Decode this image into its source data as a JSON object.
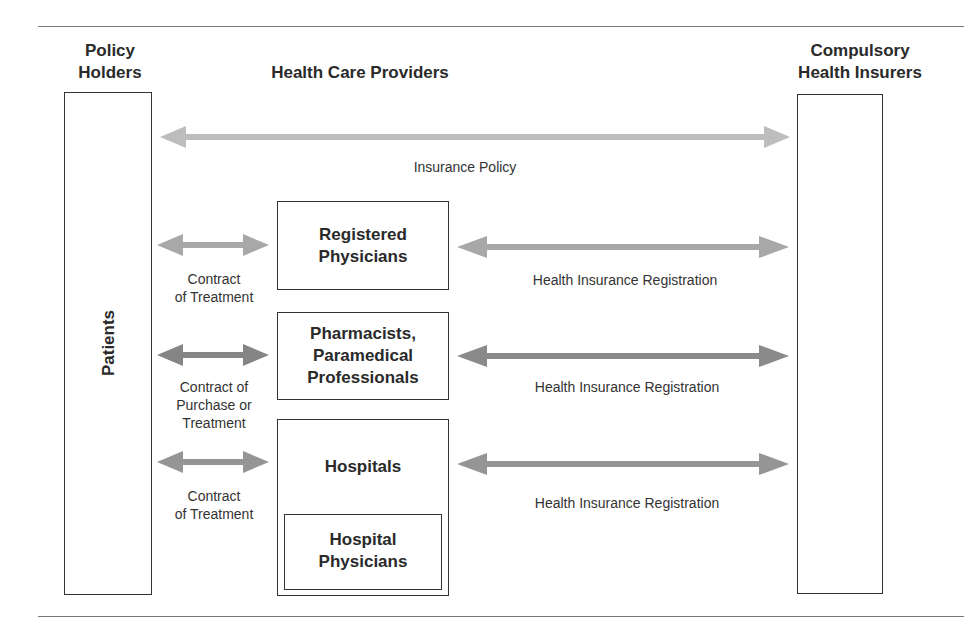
{
  "headers": {
    "policy_holders": [
      "Policy",
      "Holders"
    ],
    "providers": "Health Care Providers",
    "insurers": [
      "Compulsory",
      "Health Insurers"
    ]
  },
  "left_box": {
    "label": "Patients"
  },
  "top_relation": {
    "label": "Insurance Policy"
  },
  "providers": [
    {
      "name": [
        "Registered",
        "Physicians"
      ],
      "left_label": [
        "Contract",
        "of Treatment"
      ],
      "right_label": "Health Insurance Registration"
    },
    {
      "name": [
        "Pharmacists,",
        "Paramedical",
        "Professionals"
      ],
      "left_label": [
        "Contract of",
        "Purchase or",
        "Treatment"
      ],
      "right_label": "Health Insurance Registration"
    },
    {
      "name": [
        "Hospitals"
      ],
      "inner_box": [
        "Hospital",
        "Physicians"
      ],
      "left_label": [
        "Contract",
        "of Treatment"
      ],
      "right_label": "Health Insurance Registration"
    }
  ],
  "colors": {
    "arrow_light": "#b5b5b5",
    "arrow_mid": "#9a9a9a",
    "arrow_dark": "#7d7d7d",
    "border": "#333333"
  }
}
